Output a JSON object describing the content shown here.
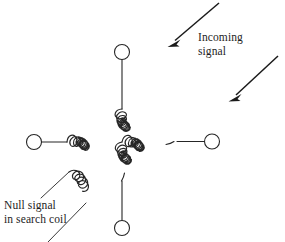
{
  "figure": {
    "background_color": "#ffffff",
    "ink_color": "#262626",
    "width": 285,
    "height": 242
  },
  "labels": {
    "incoming_signal": "Incoming\nsignal",
    "null_signal": "Null signal\nin search coil"
  },
  "arrows": [
    {
      "name": "incoming-signal-arrow-upper",
      "from": [
        219,
        3
      ],
      "to": [
        169,
        46
      ],
      "direction": "down-left"
    },
    {
      "name": "incoming-signal-arrow-lower",
      "from": [
        278,
        56
      ],
      "to": [
        229,
        100
      ],
      "direction": "down-left"
    }
  ],
  "terminals": [
    {
      "name": "terminal-top",
      "cx": 122,
      "cy": 52,
      "r": 7.5
    },
    {
      "name": "terminal-bottom",
      "cx": 122,
      "cy": 228,
      "r": 7.5
    },
    {
      "name": "terminal-left",
      "cx": 34,
      "cy": 142,
      "r": 7.5
    },
    {
      "name": "terminal-right",
      "cx": 212,
      "cy": 141,
      "r": 7.5
    }
  ],
  "coils": {
    "horizontal": {
      "name": "horizontal-coil",
      "center_y": 142,
      "x_start": 66,
      "x_end": 177,
      "turns": 13,
      "loop_radius": 8
    },
    "vertical": {
      "name": "vertical-coil",
      "center_x": 122,
      "y_start": 108,
      "y_end": 182,
      "turns": 9,
      "loop_radius": 8
    },
    "search": {
      "name": "search-coil",
      "turns": 3,
      "angle_deg": -48,
      "anchor": [
        72,
        202
      ]
    }
  },
  "colors": {
    "ink": "#262626",
    "arrow": "#1a1a1a",
    "text": "#1d1d1d",
    "background": "#ffffff"
  }
}
